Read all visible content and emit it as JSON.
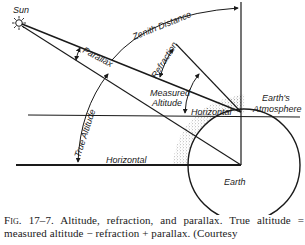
{
  "diagram": {
    "labels": {
      "sun": "Sun",
      "zenith_distance": "Zenith Distance",
      "refraction": "Refraction",
      "parallax": "Parallax",
      "measured_altitude_line1": "Measured",
      "measured_altitude_line2": "Altitude",
      "true_altitude": "True Altitude",
      "horizontal_observer": "Horizontal",
      "horizontal_center": "Horizontal",
      "earths_atmosphere_line1": "Earth's",
      "earths_atmosphere_line2": "Atmosphere",
      "earth": "Earth"
    },
    "icons": {
      "sun": "sun-icon"
    },
    "colors": {
      "ink": "#1a1a1a",
      "background": "#ffffff",
      "stipple": "#555555"
    }
  },
  "caption": {
    "figure_number": "Fig. 17–7.",
    "text": "Altitude, refraction, and parallax. True altitude = measured altitude − refraction + parallax. (Courtesy"
  }
}
